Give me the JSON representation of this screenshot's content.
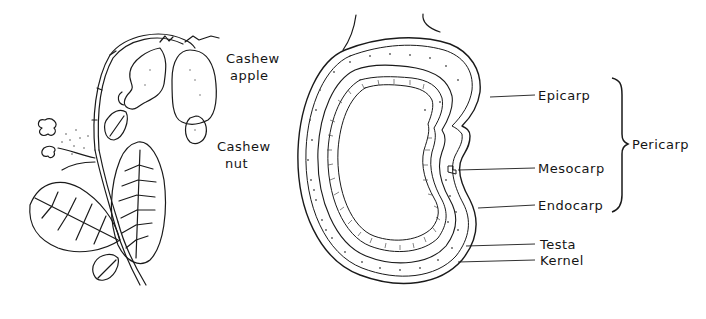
{
  "figure": {
    "left_panel": {
      "subject": "cashew-branch",
      "labels": [
        {
          "id": "cashew_apple",
          "line1": "Cashew",
          "line2": "apple"
        },
        {
          "id": "cashew_nut",
          "line1": "Cashew",
          "line2": "nut"
        }
      ]
    },
    "right_panel": {
      "subject": "cashew-nut-section",
      "labels": {
        "epicarp": "Epicarp",
        "mesocarp": "Mesocarp",
        "endocarp": "Endocarp",
        "testa": "Testa",
        "kernel": "Kernel",
        "pericarp": "Pericarp"
      }
    },
    "colors": {
      "ink": "#151515",
      "background": "#ffffff",
      "stipple": "#555555"
    }
  }
}
